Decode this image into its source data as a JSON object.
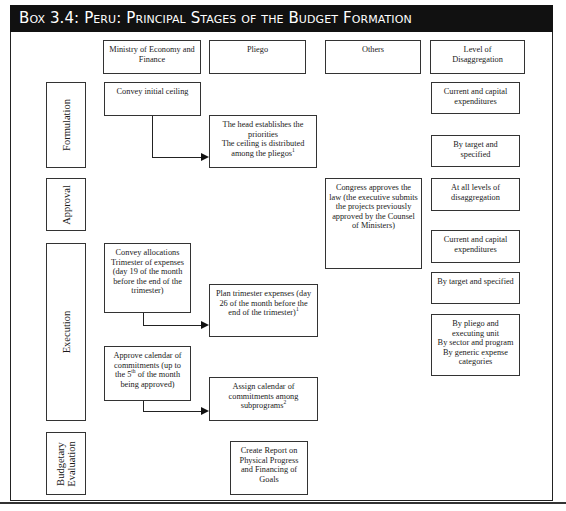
{
  "title": "Box 3.4:  Peru: Principal Stages of the Budget Formation",
  "columns": {
    "ministry": "Ministry of Economy and\nFinance",
    "pliego": "Pliego",
    "others": "Others",
    "level": "Level of\nDisaggregation"
  },
  "stages": {
    "formulation": "Formulation",
    "approval": "Approval",
    "execution": "Execution",
    "evaluation": "Budgetary\nEvaluation"
  },
  "nodes": {
    "convey_ceiling": "Convey initial ceiling",
    "head_priorities": "The head establishes the\npriorities\nThe ceiling is distributed\namong the pliegos",
    "head_priorities_sup": "1",
    "congress": "Congress approves the\nlaw (the executive submits\nthe projects previously\napproved by the Counsel\nof Ministers)",
    "convey_allocations": "Convey allocations\nTrimester of expenses\n(day 19 of the month\nbefore the end of the\ntrimester)",
    "plan_trimester": "Plan trimester expenses (day\n26 of the month before the\nend of the trimester)",
    "plan_trimester_sup": "1",
    "approve_calendar_a": "Approve calendar of\ncommitments (up to\nthe 5",
    "approve_calendar_sup": "th",
    "approve_calendar_b": " of the month\nbeing approved)",
    "assign_calendar": "Assign calendar of\ncommitments among\nsubprograms",
    "assign_calendar_sup": "2",
    "create_report": "Create Report on\nPhysical Progress\nand Financing of\nGoals"
  },
  "levels": [
    "Current and capital\nexpenditures",
    "By target  and\nspecified",
    "At all levels of\ndisaggregation",
    "Current and capital\nexpenditures",
    "By target and specified",
    "By pliego and\nexecuting unit\nBy sector and program\nBy generic expense\ncategories"
  ]
}
